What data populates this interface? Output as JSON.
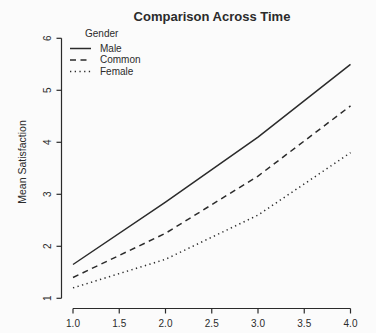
{
  "window": {
    "width": 376,
    "height": 333
  },
  "chart_data": {
    "type": "line",
    "title": "Comparison Across Time",
    "xlabel": "",
    "ylabel": "Mean Satisfaction",
    "x": [
      1,
      2,
      3,
      4
    ],
    "series": [
      {
        "name": "Male",
        "linestyle": "solid",
        "values": [
          1.65,
          2.85,
          4.1,
          5.5
        ]
      },
      {
        "name": "Common",
        "linestyle": "dashed",
        "values": [
          1.4,
          2.25,
          3.35,
          4.7
        ]
      },
      {
        "name": "Female",
        "linestyle": "dotted",
        "values": [
          1.2,
          1.75,
          2.6,
          3.8
        ]
      }
    ],
    "legend_title": "Gender",
    "legend_position": "top-left",
    "xlim": [
      1.0,
      4.0
    ],
    "ylim": [
      1,
      6
    ],
    "x_ticks": [
      1.0,
      1.5,
      2.0,
      2.5,
      3.0,
      3.5,
      4.0
    ],
    "x_tick_labels": [
      "1.0",
      "1.5",
      "2.0",
      "2.5",
      "3.0",
      "3.5",
      "4.0"
    ],
    "y_ticks": [
      1,
      2,
      3,
      4,
      5,
      6
    ],
    "y_tick_labels": [
      "1",
      "2",
      "3",
      "4",
      "5",
      "6"
    ],
    "grid": false,
    "line_color": "#2b2b2b",
    "text_color": "#2b2b2b",
    "background_color": "#fbfbfb"
  }
}
